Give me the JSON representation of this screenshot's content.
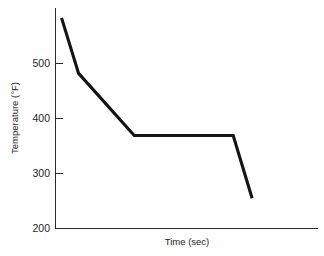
{
  "chart_data": {
    "type": "line",
    "title": "",
    "subtitle": "",
    "xlabel": "Time (sec)",
    "ylabel": "Temperature (°F)",
    "ylim": [
      200,
      600
    ],
    "xlim": [
      0,
      100
    ],
    "grid": false,
    "legend": null,
    "y_ticks": [
      {
        "value": 200,
        "label": "200"
      },
      {
        "value": 300,
        "label": "300"
      },
      {
        "value": 400,
        "label": "400"
      },
      {
        "value": 500,
        "label": "500"
      }
    ],
    "x_ticks": [],
    "series": [
      {
        "name": "cooling-curve",
        "color": "#141414",
        "x": [
          2.3,
          8.8,
          30.0,
          67.7,
          74.9
        ],
        "y": [
          583,
          482,
          369,
          369,
          255
        ],
        "points": [
          {
            "x": 2.3,
            "y": 583,
            "note": "start of cooling"
          },
          {
            "x": 8.8,
            "y": 482,
            "note": "slope change"
          },
          {
            "x": 30.0,
            "y": 369,
            "note": "start of thermal arrest plateau"
          },
          {
            "x": 67.7,
            "y": 369,
            "note": "end of thermal arrest plateau"
          },
          {
            "x": 74.9,
            "y": 255,
            "note": "end of cooling"
          }
        ]
      }
    ],
    "annotations": []
  },
  "figure": {
    "background_color": "#fefefe",
    "axis_color": "#2b2b2b",
    "line_color": "#141414"
  }
}
